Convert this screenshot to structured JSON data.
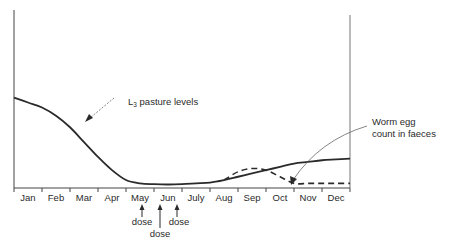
{
  "chart_data": {
    "type": "line",
    "title": "",
    "xlabel": "",
    "ylabel": "",
    "categories": [
      "Jan",
      "Feb",
      "Mar",
      "Apr",
      "May",
      "Jun",
      "July",
      "Aug",
      "Sep",
      "Oct",
      "Nov",
      "Dec"
    ],
    "ylim": [
      0,
      100
    ],
    "grid": false,
    "y_ticks_shown": false,
    "series": [
      {
        "name": "L3 pasture levels",
        "style": "solid",
        "x": [
          0,
          0.5,
          1,
          1.5,
          2,
          2.5,
          3,
          3.5,
          4,
          4.5,
          5,
          5.5,
          6,
          6.5,
          7,
          7.5,
          8,
          8.5,
          9,
          9.5,
          10,
          10.5,
          11,
          11.5,
          12
        ],
        "values": [
          53,
          50,
          47,
          42,
          35,
          26,
          17,
          9,
          3,
          1,
          0.5,
          0.3,
          0.5,
          1,
          1.5,
          3,
          5,
          7,
          9,
          11,
          13,
          14,
          15,
          15.5,
          16
        ]
      },
      {
        "name": "Worm egg count in faeces",
        "style": "dashed",
        "x": [
          7.5,
          8,
          8.5,
          9,
          9.5,
          10,
          10.5,
          11,
          11.5,
          12
        ],
        "values": [
          3,
          8,
          10,
          9,
          5,
          1,
          1,
          1,
          1,
          1
        ]
      }
    ],
    "annotations": [
      {
        "text_main": "L",
        "text_sub": "3",
        "text_rest": " pasture levels",
        "arrow_to": "solid curve at Mar/Apr"
      },
      {
        "text_lines": [
          "Worm egg",
          "count in faeces"
        ],
        "arrow_to": "dashed curve at Nov"
      },
      {
        "text": "dose",
        "x": "mid-May",
        "arrow": "up"
      },
      {
        "text": "dose",
        "x": "early Jun",
        "arrow": "up"
      },
      {
        "text": "dose",
        "x": "late Jun",
        "arrow": "up"
      }
    ],
    "legend": "none (inline annotations)"
  },
  "labels": {
    "l3_main": "L",
    "l3_sub": "3",
    "l3_rest": " pasture levels",
    "worm_line1": "Worm egg",
    "worm_line2": "count in faeces",
    "dose": "dose"
  }
}
